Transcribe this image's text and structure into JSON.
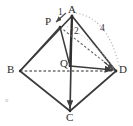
{
  "figure": {
    "type": "tetrahedron-geometry-diagram",
    "canvas": {
      "width": 133,
      "height": 126
    },
    "stroke_color": "#3c3c3c",
    "dash_color": "#6e6e6e",
    "dot_color": "#b0b0b0",
    "points": {
      "A": {
        "x": 72,
        "y": 16,
        "label": "A"
      },
      "P": {
        "x": 60,
        "y": 27,
        "label": "P"
      },
      "B": {
        "x": 20,
        "y": 71,
        "label": "B"
      },
      "Q": {
        "x": 70,
        "y": 66,
        "label": "Q"
      },
      "C": {
        "x": 70,
        "y": 111,
        "label": "C"
      },
      "D": {
        "x": 116,
        "y": 71,
        "label": "D"
      }
    },
    "measure_labels": {
      "PA": "1",
      "AQ": "2",
      "AD": "4"
    },
    "corner_glyph": " ˚"
  }
}
